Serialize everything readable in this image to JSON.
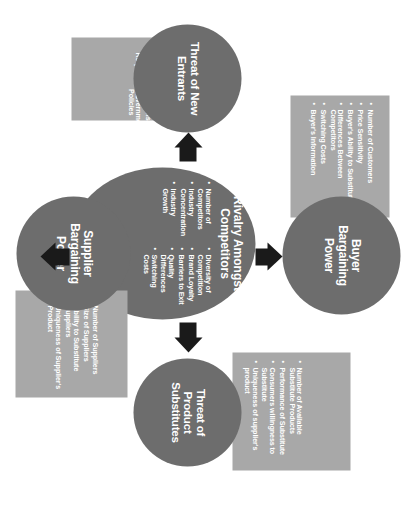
{
  "diagram": {
    "type": "porters-five-forces",
    "colors": {
      "circle_fill": "#6d6d6d",
      "panel_fill": "#a8a8a8",
      "arrow_fill": "#1a1a1a",
      "text": "#ffffff",
      "background": "#ffffff"
    },
    "forces": {
      "buyer": {
        "title": "Buyer\nBargaining\nPower",
        "title_lines": [
          "Buyer",
          "Bargaining",
          "Power"
        ],
        "items": [
          "Number of Customers",
          "Price Sensitivity",
          "Buyer's Ability to Substitutes",
          "Differences Between Competitors",
          "Switching Costs",
          "Buyer's Information"
        ]
      },
      "new_entrants": {
        "title_lines": [
          "Threat of New",
          "Entrants"
        ],
        "items_left": [
          "Economies of Scale",
          "Brand Loyalty",
          "Capital Requirements"
        ],
        "items_right": [
          "Switching Costs",
          "Access to Distribution Channels",
          "Government Policies"
        ]
      },
      "rivalry": {
        "title_lines": [
          "Rivalry Amongst",
          "Competitors"
        ],
        "items_left": [
          "Number of Competitors",
          "Industry Concentration",
          "Industry Growth"
        ],
        "items_right": [
          "Diversity of Competition",
          "Brand Loyalty",
          "Barriers to Exit",
          "Quality Differences",
          "Switching Costs"
        ]
      },
      "substitutes": {
        "title_lines": [
          "Threat of",
          "Product",
          "Substitutes"
        ],
        "items": [
          "Number of Available Substitute Products",
          "Performance of Substitute",
          "Consumers willingness to Substitute",
          "Uniqueness of supplier's product"
        ]
      },
      "supplier": {
        "title_lines": [
          "Supplier",
          "Bargaining",
          "Power"
        ],
        "items": [
          "Number of Suppliers",
          "Size of Suppliers",
          "Ability to Substitute Suppliers",
          "Uniqueness of Supplier's Product"
        ]
      }
    },
    "arrows": {
      "up": "arrow-up",
      "down": "arrow-down",
      "left": "arrow-left",
      "right": "arrow-right"
    }
  }
}
